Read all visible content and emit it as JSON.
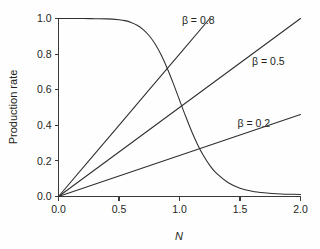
{
  "chart_data": {
    "type": "line",
    "title": "",
    "xlabel": "N",
    "ylabel": "Production rate",
    "xlim": [
      0.0,
      2.0
    ],
    "ylim": [
      0.0,
      1.0
    ],
    "grid": false,
    "legend_position": "inline-annotations",
    "xticks": [
      "0.0",
      "0.5",
      "1.0",
      "1.5",
      "2.0"
    ],
    "xtick_values": [
      0.0,
      0.5,
      1.0,
      1.5,
      2.0
    ],
    "yticks": [
      "0.0",
      "0.2",
      "0.4",
      "0.6",
      "0.8",
      "1.0"
    ],
    "ytick_values": [
      0.0,
      0.2,
      0.4,
      0.6,
      0.8,
      1.0
    ],
    "annotations": [
      {
        "text": "β = 0.8",
        "x": 1.02,
        "y": 0.99
      },
      {
        "text": "β = 0.5",
        "x": 1.6,
        "y": 0.76
      },
      {
        "text": "β = 0.2",
        "x": 1.48,
        "y": 0.41
      }
    ],
    "series": [
      {
        "name": "β = 0.8",
        "type": "line",
        "x": [
          0.0,
          0.25,
          0.5,
          0.75,
          1.0,
          1.25
        ],
        "values": [
          0.0,
          0.2,
          0.4,
          0.6,
          0.8,
          1.0
        ]
      },
      {
        "name": "β = 0.5",
        "type": "line",
        "x": [
          0.0,
          0.5,
          1.0,
          1.5,
          2.0
        ],
        "values": [
          0.0,
          0.25,
          0.5,
          0.75,
          1.0
        ]
      },
      {
        "name": "β = 0.2",
        "type": "line",
        "x": [
          0.0,
          0.5,
          1.0,
          1.5,
          2.0
        ],
        "values": [
          0.0,
          0.115,
          0.23,
          0.345,
          0.46
        ]
      },
      {
        "name": "inhibition curve",
        "type": "line",
        "x": [
          0.0,
          0.1,
          0.2,
          0.3,
          0.4,
          0.5,
          0.55,
          0.6,
          0.65,
          0.7,
          0.75,
          0.8,
          0.85,
          0.9,
          0.95,
          1.0,
          1.05,
          1.1,
          1.15,
          1.2,
          1.25,
          1.3,
          1.4,
          1.5,
          1.6,
          1.7,
          1.8,
          1.9,
          2.0
        ],
        "values": [
          1.0,
          1.0,
          1.0,
          0.999,
          0.998,
          0.993,
          0.988,
          0.978,
          0.962,
          0.938,
          0.903,
          0.855,
          0.793,
          0.718,
          0.633,
          0.542,
          0.452,
          0.367,
          0.291,
          0.227,
          0.175,
          0.134,
          0.079,
          0.047,
          0.03,
          0.021,
          0.016,
          0.013,
          0.011
        ]
      }
    ]
  },
  "colors": {
    "background": "#fefefe",
    "axis": "#3a3a3a",
    "curve": "#2e2e2e",
    "text": "#231f20"
  }
}
